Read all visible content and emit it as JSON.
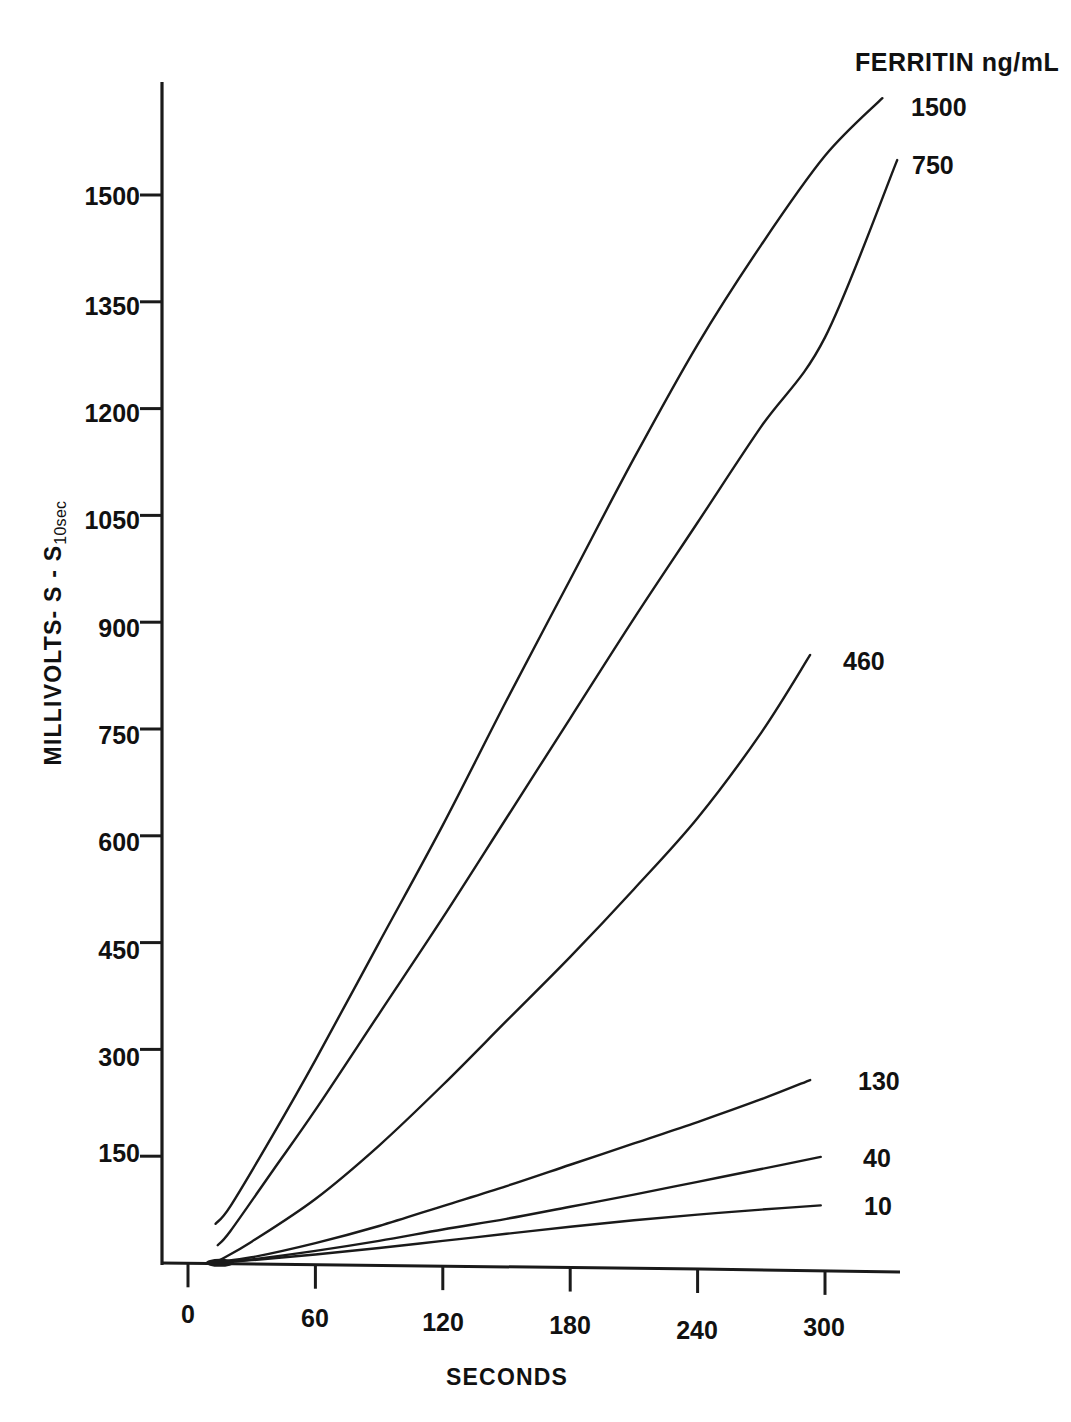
{
  "chart_data": {
    "type": "line",
    "title": "",
    "legend_title": "FERRITIN ng/mL",
    "legend_position": "right-of-curve-ends",
    "xlabel": "SECONDS",
    "ylabel_main": "MILLIVOLTS- S - S",
    "ylabel_sub": "10sec",
    "xlim": [
      0,
      345
    ],
    "ylim": [
      0,
      1660
    ],
    "xticks": [
      0,
      60,
      120,
      180,
      240,
      300
    ],
    "yticks": [
      150,
      300,
      450,
      600,
      750,
      900,
      1050,
      1200,
      1350,
      1500
    ],
    "grid": false,
    "axis_color": "#1a1a1a",
    "line_color": "#1a1a1a",
    "series": [
      {
        "name": "1500",
        "label": "1500",
        "x": [
          13,
          20,
          40,
          60,
          90,
          120,
          150,
          180,
          210,
          240,
          270,
          300,
          327
        ],
        "y": [
          55,
          80,
          180,
          285,
          450,
          615,
          790,
          960,
          1130,
          1290,
          1430,
          1555,
          1636
        ]
      },
      {
        "name": "750",
        "label": "750",
        "x": [
          14,
          20,
          40,
          60,
          90,
          120,
          150,
          180,
          210,
          240,
          270,
          300,
          334
        ],
        "y": [
          25,
          45,
          130,
          215,
          350,
          485,
          625,
          765,
          905,
          1040,
          1175,
          1300,
          1549
        ]
      },
      {
        "name": "460",
        "label": "460",
        "x": [
          15,
          30,
          60,
          90,
          120,
          150,
          180,
          210,
          240,
          270,
          293
        ],
        "y": [
          4,
          30,
          90,
          165,
          250,
          340,
          430,
          525,
          625,
          745,
          854
        ]
      },
      {
        "name": "130",
        "label": "130",
        "x": [
          15,
          30,
          60,
          90,
          120,
          150,
          180,
          210,
          240,
          270,
          293
        ],
        "y": [
          2,
          8,
          28,
          52,
          80,
          108,
          138,
          168,
          198,
          230,
          257
        ]
      },
      {
        "name": "40",
        "label": "40",
        "x": [
          15,
          30,
          60,
          90,
          120,
          150,
          180,
          210,
          240,
          270,
          298
        ],
        "y": [
          1,
          5,
          17,
          31,
          47,
          62,
          79,
          96,
          114,
          132,
          149
        ]
      },
      {
        "name": "10",
        "label": "10",
        "x": [
          15,
          30,
          60,
          90,
          120,
          150,
          180,
          210,
          240,
          270,
          298
        ],
        "y": [
          1,
          4,
          12,
          21,
          31,
          41,
          51,
          60,
          68,
          75,
          81
        ]
      }
    ]
  },
  "axes": {
    "ytick_labels": [
      "1500",
      "1350",
      "1200",
      "1050",
      "900",
      "750",
      "600",
      "450",
      "300",
      "150"
    ],
    "xtick_labels": [
      "0",
      "60",
      "120",
      "180",
      "240",
      "300"
    ]
  },
  "legend": {
    "title": "FERRITIN ng/mL",
    "entries": [
      {
        "label": "1500"
      },
      {
        "label": "750"
      },
      {
        "label": "460"
      },
      {
        "label": "130"
      },
      {
        "label": "40"
      },
      {
        "label": "10"
      }
    ]
  },
  "labels": {
    "xaxis_title": "SECONDS",
    "yaxis_title_main": "MILLIVOLTS- S - S",
    "yaxis_title_sub": "10sec"
  }
}
